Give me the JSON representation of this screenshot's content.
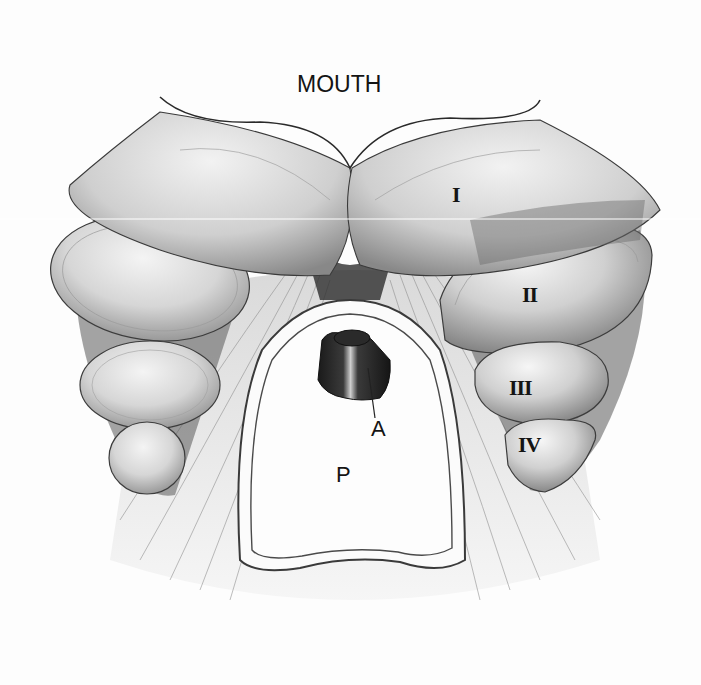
{
  "figure": {
    "type": "anatomical-illustration",
    "style": "grayscale pencil drawing",
    "labels": {
      "mouth": "MOUTH",
      "lobe_1": "I",
      "lobe_2": "II",
      "lobe_3": "III",
      "lobe_4": "IV",
      "aperture": "A",
      "plate": "P"
    }
  }
}
